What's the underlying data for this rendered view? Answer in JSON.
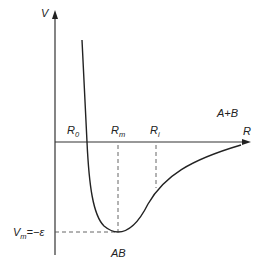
{
  "diagram": {
    "axes": {
      "y_label": "V",
      "x_label": "R"
    },
    "markers": {
      "r0": {
        "main": "R",
        "sub": "0"
      },
      "rm": {
        "main": "R",
        "sub": "m"
      },
      "ri": {
        "main": "R",
        "sub": "i"
      }
    },
    "annotations": {
      "dissociated": "A+B",
      "bound": "AB",
      "minimum": {
        "main": "V",
        "sub": "m",
        "rest": "=−ε"
      }
    },
    "colors": {
      "line": "#222222",
      "dashed": "#555555"
    }
  }
}
